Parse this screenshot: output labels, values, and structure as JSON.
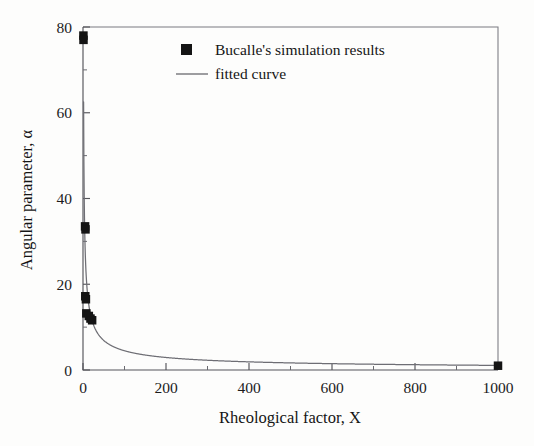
{
  "chart_data": {
    "type": "scatter",
    "title": "",
    "xlabel": "Rheological factor, X",
    "ylabel": "Angular parameter, α",
    "xlim": [
      0,
      1000
    ],
    "ylim": [
      0,
      80
    ],
    "xticks": [
      0,
      200,
      400,
      600,
      800,
      1000
    ],
    "yticks": [
      0,
      20,
      40,
      60,
      80
    ],
    "xtick_labels": [
      "0",
      "200",
      "400",
      "600",
      "800",
      "1000"
    ],
    "ytick_labels": [
      "0",
      "20",
      "40",
      "60",
      "80"
    ],
    "x_minor_step": 100,
    "y_minor_step": 10,
    "grid": false,
    "legend_position": "upper-center",
    "series": [
      {
        "name": "Bucalle's simulation results",
        "type": "scatter",
        "marker": "square",
        "color": "#141414",
        "points": [
          {
            "x": 1.0,
            "y": 78.0
          },
          {
            "x": 1.2,
            "y": 77.0
          },
          {
            "x": 5.0,
            "y": 33.5
          },
          {
            "x": 6.0,
            "y": 32.8
          },
          {
            "x": 5.5,
            "y": 17.2
          },
          {
            "x": 7.0,
            "y": 16.5
          },
          {
            "x": 8.0,
            "y": 13.2
          },
          {
            "x": 14.0,
            "y": 12.6
          },
          {
            "x": 18.0,
            "y": 12.0
          },
          {
            "x": 22.0,
            "y": 11.6
          },
          {
            "x": 1000.0,
            "y": 1.0
          }
        ]
      },
      {
        "name": "fitted curve",
        "type": "line",
        "color": "#6e6e74",
        "fit": "power-law",
        "equation": "alpha = 78 * X^(-0.62)",
        "coefficients": {
          "a": 78.0,
          "b": -0.62
        }
      }
    ]
  },
  "legend": {
    "entries": [
      {
        "label": "Bucalle's simulation results",
        "symbol": "square-marker"
      },
      {
        "label": "fitted curve",
        "symbol": "line-sample"
      }
    ]
  },
  "axes": {
    "x_title": "Rheological factor, X",
    "y_title": "Angular parameter, α"
  }
}
